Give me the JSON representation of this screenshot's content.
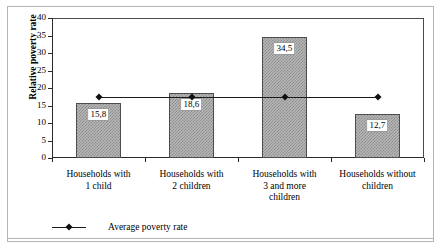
{
  "figure": {
    "decimal_separator": ",",
    "ghost_text_top": "",
    "frame_color": "#b4b4b4"
  },
  "chart_data": {
    "type": "bar",
    "title": "",
    "subtitle": "",
    "xlabel": "",
    "ylabel": "Relative poverty rate",
    "categories": [
      "Households with 1 child",
      "Households with 2 children",
      "Households with 3 and more children",
      "Households without children"
    ],
    "category_lines": [
      [
        "Households with",
        "1 child"
      ],
      [
        "Households with",
        "2 children"
      ],
      [
        "Households with",
        "3 and more",
        "children"
      ],
      [
        "Households without",
        "children"
      ]
    ],
    "values": [
      15.8,
      18.6,
      34.5,
      12.7
    ],
    "value_labels": [
      "15,8",
      "18,6",
      "34,5",
      "12,7"
    ],
    "ylim": [
      0,
      40
    ],
    "ytick_step": 5,
    "yticks": [
      40,
      35,
      30,
      25,
      20,
      15,
      10,
      5,
      0
    ],
    "ytick_labels": [
      "40",
      "35",
      "30",
      "25",
      "20",
      "15",
      "10",
      "5",
      "0"
    ],
    "grid": false,
    "legend_position": "bottom-left",
    "series": [
      {
        "name": "Relative poverty rate",
        "type": "bar",
        "values": [
          15.8,
          18.6,
          34.5,
          12.7
        ],
        "fill": "checkerboard-gray",
        "fill_color": "#b7b7b7",
        "edge_color": "#4d4d4d",
        "show_labels": true
      },
      {
        "name": "Average poverty rate",
        "type": "line",
        "values": [
          17.4,
          17.4,
          17.4,
          17.4
        ],
        "marker": "diamond",
        "color": "#111111"
      }
    ],
    "legend": [
      {
        "label": "Average poverty rate",
        "marker": "line-diamond",
        "color": "#111111"
      }
    ]
  }
}
